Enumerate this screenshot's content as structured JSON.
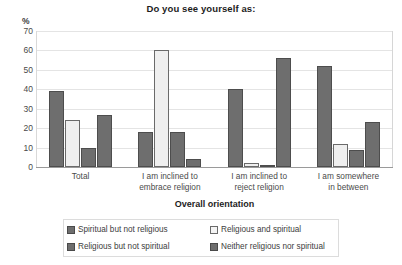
{
  "chart_data": {
    "type": "bar",
    "title": "Do you see yourself as:",
    "xlabel": "Overall orientation",
    "ylabel": "%",
    "ylim": [
      0,
      70
    ],
    "yticks": [
      70,
      60,
      50,
      40,
      30,
      20,
      10,
      0
    ],
    "grid": true,
    "legend_position": "bottom",
    "categories": [
      "Total",
      "I am inclined to embrace religion",
      "I am inclined to reject religion",
      "I am somewhere in between"
    ],
    "category_lines": [
      [
        "Total"
      ],
      [
        "I am inclined to",
        "embrace religion"
      ],
      [
        "I am inclined to",
        "reject religion"
      ],
      [
        "I am somewhere",
        "in between"
      ]
    ],
    "series": [
      {
        "name": "Spiritual but not religious",
        "color": "#6e6e6e",
        "values": [
          39,
          18,
          40,
          52
        ]
      },
      {
        "name": "Religious and spiritual",
        "color": "#efefef",
        "values": [
          24,
          60,
          2,
          12
        ]
      },
      {
        "name": "Religious but not spiritual",
        "color": "#6e6e6e",
        "values": [
          10,
          18,
          1,
          9
        ]
      },
      {
        "name": "Neither religious nor spiritual",
        "color": "#6e6e6e",
        "values": [
          27,
          4,
          56,
          23
        ]
      }
    ]
  },
  "legend": {
    "items": [
      {
        "label": "Spiritual but not religious",
        "style": "dark"
      },
      {
        "label": "Religious and spiritual",
        "style": "light"
      },
      {
        "label": "Religious but not spiritual",
        "style": "dark"
      },
      {
        "label": "Neither religious nor spiritual",
        "style": "dark"
      }
    ]
  }
}
